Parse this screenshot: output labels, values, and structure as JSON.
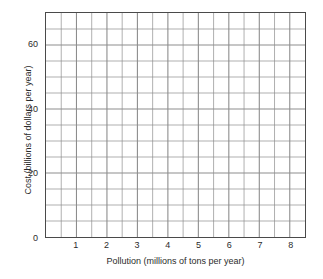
{
  "chart_data": {
    "type": "line",
    "title": "",
    "subtitle": "",
    "xlabel": "Pollution (millions of tons per year)",
    "ylabel": "Cost (billions of dollars per year)",
    "xlim": [
      0,
      8.5
    ],
    "ylim": [
      0,
      70
    ],
    "x_major_ticks": [
      1,
      2,
      3,
      4,
      5,
      6,
      7,
      8
    ],
    "x_tick_labels": [
      "1",
      "2",
      "3",
      "4",
      "5",
      "6",
      "7",
      "8"
    ],
    "y_major_ticks": [
      0,
      20,
      40,
      60
    ],
    "y_tick_labels": [
      "0",
      "20",
      "40",
      "60"
    ],
    "x_grid_step": 0.5,
    "y_grid_step": 5,
    "grid": true,
    "legend": "none",
    "series": [],
    "values": [],
    "categories": [],
    "annotations": [],
    "note": "Empty grid; no data plotted"
  },
  "style": {
    "background": "#ffffff",
    "grid_color": "#8d8d8d",
    "frame_color": "#4a4a4a",
    "text_color": "#2b2b2b"
  }
}
